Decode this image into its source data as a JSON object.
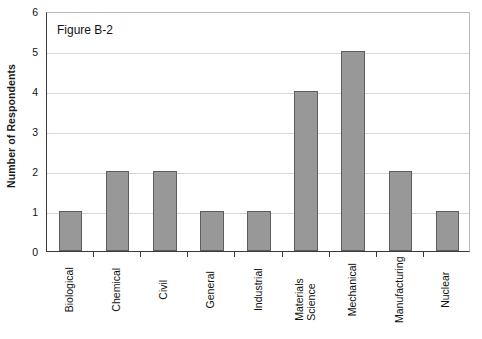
{
  "caption": "Figure B-2",
  "chart_data": {
    "type": "bar",
    "title": "Figure B-2",
    "xlabel": "",
    "ylabel": "Number of Respondents",
    "categories": [
      "Biological",
      "Chemical",
      "Civil",
      "General",
      "Industrial",
      "Materials Science",
      "Mechanical",
      "Manufacturing",
      "Nuclear"
    ],
    "category_lines": [
      [
        "Biological"
      ],
      [
        "Chemical"
      ],
      [
        "Civil"
      ],
      [
        "General"
      ],
      [
        "Industrial"
      ],
      [
        "Materials",
        "Science"
      ],
      [
        "Mechanical"
      ],
      [
        "Manufacturing"
      ],
      [
        "Nuclear"
      ]
    ],
    "values": [
      1,
      2,
      2,
      1,
      1,
      4,
      5,
      2,
      1
    ],
    "ylim": [
      0,
      6
    ],
    "yticks": [
      0,
      1,
      2,
      3,
      4,
      5,
      6
    ],
    "ytick_labels": [
      "0",
      "1",
      "2",
      "3",
      "4",
      "5",
      "6"
    ],
    "grid": true,
    "grid_axis": "y",
    "legend": false,
    "bar_color": "#989898",
    "bar_edge_color": "#5d5d5d",
    "gridline_color": "#d6d6d6",
    "axis_color": "#3a3a3a"
  }
}
